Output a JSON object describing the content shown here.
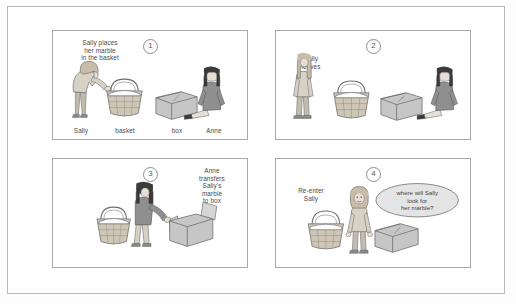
{
  "document": {
    "title": "Sally-Anne false belief test",
    "background_color": "#fdfdfd",
    "frame_color": "#b9b9b9"
  },
  "panels": [
    {
      "number": "1",
      "caption": "Sally places\nher marble\nin the basket",
      "caption_position": "top-left",
      "object_labels": [
        "Sally",
        "basket",
        "box",
        "Anne"
      ],
      "figures": [
        "sally-bending",
        "basket-with-marble",
        "box-closed",
        "anne-sitting"
      ]
    },
    {
      "number": "2",
      "caption": "Sally\nleaves",
      "caption_position": "top-left",
      "object_labels": [],
      "figures": [
        "sally-standing-leaving",
        "basket-with-marble",
        "box-closed",
        "anne-sitting"
      ]
    },
    {
      "number": "3",
      "caption": "Anne\ntransfers\nSally's\nmarble\nto box",
      "caption_position": "top-right",
      "object_labels": [],
      "figures": [
        "basket-with-marble",
        "anne-bending",
        "box-open"
      ]
    },
    {
      "number": "4",
      "caption": "Re-enter\nSally",
      "caption_position": "top-left",
      "object_labels": [],
      "figures": [
        "basket-empty",
        "sally-standing",
        "box-closed"
      ],
      "speech_bubble": "where will Sally\nlook for\nher marble?"
    }
  ],
  "colors": {
    "panel_border": "#a8a8a8",
    "text": "#4a4a4a",
    "skin": "#e9ded2",
    "hair_light": "#c9bda9",
    "hair_dark": "#3b3b3b",
    "shirt_light": "#d8d2c6",
    "shirt_dark": "#8f8f8f",
    "pants": "#c3bcae",
    "basket": "#cfc7b6",
    "box": "#c6c6c6",
    "bubble_fill": "#e4e4e4"
  }
}
